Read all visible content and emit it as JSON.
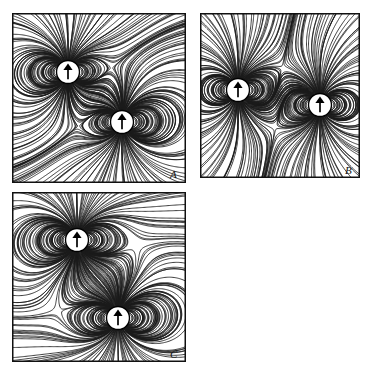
{
  "figure": {
    "background_color": "#ffffff",
    "line_color": "#1a1a1a",
    "dashed_color": "#2a2a2a",
    "frame_color": "#111111",
    "dipole_fill": "#ffffff",
    "dipole_stroke": "#000000",
    "arrow_color": "#000000",
    "width": 374,
    "height": 373,
    "panel_count": 3,
    "dipole_icon_name": "dipole-arrow-up"
  },
  "panels": [
    {
      "id": "A",
      "label": "A",
      "frame": {
        "x": 12,
        "y": 13,
        "w": 174,
        "h": 170
      },
      "label_pos": {
        "x": 170,
        "y": 168
      },
      "arrangement": "diagonal-offset",
      "dipoles": [
        {
          "name": "dipole-upper-left",
          "cx": 68,
          "cy": 72,
          "r": 11.5,
          "moment": "up"
        },
        {
          "name": "dipole-lower-right",
          "cx": 122,
          "cy": 122,
          "r": 11.5,
          "moment": "up"
        }
      ],
      "neutral_point": {
        "x": 100,
        "y": 92
      },
      "separatrix_style": "dashed"
    },
    {
      "id": "B",
      "label": "B",
      "frame": {
        "x": 200,
        "y": 13,
        "w": 160,
        "h": 165
      },
      "label_pos": {
        "x": 345,
        "y": 164
      },
      "arrangement": "side-by-side",
      "dipoles": [
        {
          "name": "dipole-left",
          "cx": 238,
          "cy": 90,
          "r": 11.5,
          "moment": "up"
        },
        {
          "name": "dipole-right",
          "cx": 320,
          "cy": 105,
          "r": 11.5,
          "moment": "up"
        }
      ],
      "neutral_point": {
        "x": 278,
        "y": 96
      },
      "separatrix_style": "dashed"
    },
    {
      "id": "C",
      "label": "C",
      "frame": {
        "x": 12,
        "y": 192,
        "w": 174,
        "h": 170
      },
      "label_pos": {
        "x": 170,
        "y": 348
      },
      "arrangement": "vertical-offset",
      "dipoles": [
        {
          "name": "dipole-upper",
          "cx": 77,
          "cy": 240,
          "r": 11.5,
          "moment": "up"
        },
        {
          "name": "dipole-lower",
          "cx": 118,
          "cy": 318,
          "r": 11.5,
          "moment": "up"
        }
      ],
      "neutral_point": {
        "x": 96,
        "y": 278
      },
      "separatrix_style": "dashed"
    }
  ]
}
